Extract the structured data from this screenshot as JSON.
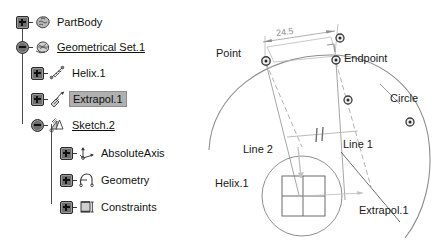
{
  "app": {
    "kind": "cad-spec-tree-and-sketch-diagram"
  },
  "tree": {
    "nodes": [
      {
        "id": "partbody",
        "label": "PartBody",
        "icon": "partbody-icon",
        "toggle": "plus",
        "depth": 0,
        "underline": false,
        "selected": false
      },
      {
        "id": "geoset",
        "label": "Geometrical Set.1",
        "icon": "geometrical-set-icon",
        "toggle": "minus",
        "depth": 0,
        "underline": true,
        "selected": false
      },
      {
        "id": "helix",
        "label": "Helix.1",
        "icon": "helix-icon",
        "toggle": "plus",
        "depth": 1,
        "underline": false,
        "selected": false
      },
      {
        "id": "extrapol",
        "label": "Extrapol.1",
        "icon": "extrapol-icon",
        "toggle": "plus",
        "depth": 1,
        "underline": false,
        "selected": true
      },
      {
        "id": "sketch",
        "label": "Sketch.2",
        "icon": "sketch-icon",
        "toggle": "minus",
        "depth": 1,
        "underline": true,
        "selected": false
      },
      {
        "id": "absoluteaxis",
        "label": "AbsoluteAxis",
        "icon": "absolute-axis-icon",
        "toggle": "plus",
        "depth": 2,
        "underline": false,
        "selected": false
      },
      {
        "id": "geometry",
        "label": "Geometry",
        "icon": "geometry-icon",
        "toggle": "plus",
        "depth": 2,
        "underline": false,
        "selected": false
      },
      {
        "id": "constraints",
        "label": "Constraints",
        "icon": "constraints-icon",
        "toggle": "plus",
        "depth": 2,
        "underline": false,
        "selected": false
      }
    ]
  },
  "diagram": {
    "labels": {
      "point": "Point",
      "endpoint": "Endpoint",
      "circle": "Circle",
      "line1": "Line 1",
      "line2": "Line 2",
      "helix": "Helix.1",
      "extrapol": "Extrapol.1",
      "dimension": "24.5"
    },
    "colors": {
      "geometry_line": "#9a9a9a",
      "annotation_text": "#1a1a1a",
      "dimension_text": "#8d8d8d",
      "marker_fill": "#3a3a3a",
      "selected_highlight": "#b0b0b0"
    }
  }
}
